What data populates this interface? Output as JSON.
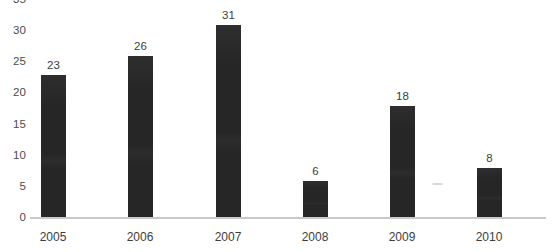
{
  "chart_data": {
    "type": "bar",
    "title": "",
    "subtitle": "",
    "xlabel": "",
    "ylabel": "",
    "categories": [
      "2005",
      "2006",
      "2007",
      "2008",
      "2009",
      "2010"
    ],
    "values": [
      23,
      26,
      31,
      6,
      18,
      8
    ],
    "value_labels": [
      "23",
      "26",
      "31",
      "6",
      "18",
      "8"
    ],
    "ylim": [
      0,
      35
    ],
    "ytick_step": 5,
    "yticks": [
      0,
      5,
      10,
      15,
      20,
      25,
      30,
      35
    ],
    "ytick_labels": [
      "0",
      "5",
      "10",
      "15",
      "20",
      "25",
      "30",
      "35"
    ],
    "grid": false,
    "legend": false,
    "legend_position": "none",
    "series": [
      {
        "name": "",
        "values": [
          23,
          26,
          31,
          6,
          18,
          8
        ],
        "color": "#262626"
      }
    ],
    "colors": {
      "bar": "#262626",
      "axis_line": "#c9c9c9",
      "tick_label": "#4c4c4c",
      "value_label": "#3d3d3d",
      "category_label": "#3d3d3d",
      "background": "#ffffff"
    }
  }
}
